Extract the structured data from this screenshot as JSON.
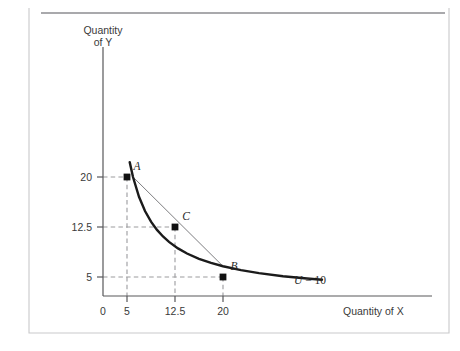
{
  "figure": {
    "kind": "indifference-curve-diagram",
    "background_color": "#ffffff",
    "frame_border_color": "#c9c9cb",
    "top_rule_color": "#8d8d90",
    "axis_color": "#58585a",
    "curve_color": "#1b1b1b",
    "chord_color": "#6e6e72",
    "guide_color": "#9b9b9e",
    "marker_color": "#111111"
  },
  "chart_data": {
    "type": "line",
    "title": "",
    "subtitle": "",
    "xlabel": "Quantity of X",
    "ylabel_line1": "Quantity",
    "ylabel_line2": "of Y",
    "grid": false,
    "legend_position": "inline-right",
    "xlim": [
      0,
      38
    ],
    "ylim": [
      0,
      29
    ],
    "xticks": [
      0,
      5,
      12.5,
      20
    ],
    "xtick_labels": [
      "0",
      "5",
      "12.5",
      "20"
    ],
    "yticks": [
      5,
      12.5,
      20
    ],
    "ytick_labels": [
      "5",
      "12.5",
      "20"
    ],
    "series": [
      {
        "name": "U = 10",
        "kind": "indifference-curve",
        "equation": "X*Y = 100",
        "style": "solid-thick",
        "x": [
          4.45,
          5,
          6,
          7,
          8,
          9,
          10,
          11,
          12.5,
          14,
          16,
          18,
          20,
          23,
          26,
          30,
          34,
          36.5
        ],
        "y": [
          22.5,
          20,
          16.67,
          14.29,
          12.5,
          11.11,
          10,
          9.09,
          8,
          7.14,
          6.25,
          5.56,
          5,
          4.35,
          3.85,
          3.33,
          2.94,
          2.74
        ]
      },
      {
        "name": "chord AB",
        "kind": "straight-line-segment",
        "style": "thin-solid",
        "x": [
          5,
          20
        ],
        "y": [
          20,
          5
        ]
      }
    ],
    "points": [
      {
        "label": "A",
        "x": 5,
        "y": 20,
        "marker": "filled-square",
        "label_dx": 7,
        "label_dy": -5
      },
      {
        "label": "C",
        "x": 12.5,
        "y": 12.5,
        "marker": "filled-square",
        "label_dx": 8,
        "label_dy": -6
      },
      {
        "label": "B",
        "x": 20,
        "y": 5,
        "marker": "filled-square",
        "label_dx": 8,
        "label_dy": -6
      }
    ],
    "guide_lines": [
      {
        "from_point": "A",
        "to_axis": "y",
        "value": 20,
        "style": "dashed"
      },
      {
        "from_point": "A",
        "to_axis": "x",
        "value": 5,
        "style": "dashed"
      },
      {
        "from_point": "C",
        "to_axis": "y",
        "value": 12.5,
        "style": "dashed"
      },
      {
        "from_point": "C",
        "to_axis": "x",
        "value": 12.5,
        "style": "dashed"
      },
      {
        "from_point": "B",
        "to_axis": "y",
        "value": 5,
        "style": "dashed"
      },
      {
        "from_point": "B",
        "to_axis": "x",
        "value": 20,
        "style": "dashed"
      }
    ],
    "annotations": [
      {
        "name": "curve-utility-label",
        "text_prefix": "U",
        "text_suffix": " = 10",
        "x": 27.5,
        "y": 4.6
      }
    ]
  }
}
